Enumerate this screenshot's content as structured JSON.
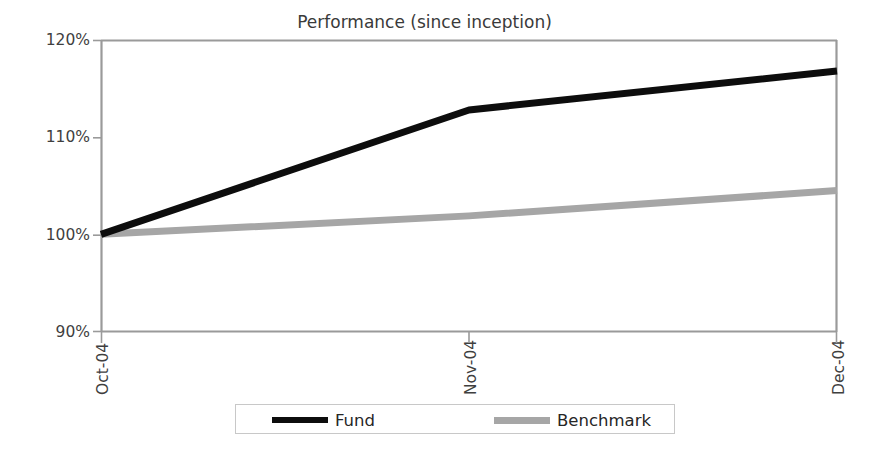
{
  "chart_data": {
    "type": "line",
    "title": "Performance (since inception)",
    "xlabel": "",
    "ylabel": "",
    "categories": [
      "Oct-04",
      "Nov-04",
      "Dec-04"
    ],
    "series": [
      {
        "name": "Fund",
        "values": [
          100.0,
          112.8,
          116.8
        ],
        "color": "#0d0d0d"
      },
      {
        "name": "Benchmark",
        "values": [
          100.0,
          101.9,
          104.5
        ],
        "color": "#a6a6a6"
      }
    ],
    "yticks": [
      "90%",
      "100%",
      "110%",
      "120%"
    ],
    "ytick_values": [
      90,
      100,
      110,
      120
    ],
    "ylim": [
      90,
      120
    ],
    "grid": false,
    "legend_position": "bottom",
    "axis_color": "#9a9a9a",
    "background": "#ffffff"
  },
  "chart": {
    "title": "Performance (since inception)",
    "ytick_labels": [
      "120%",
      "110%",
      "100%",
      "90%"
    ],
    "xtick_labels": [
      "Oct-04",
      "Nov-04",
      "Dec-04"
    ],
    "legend": {
      "fund_label": "Fund",
      "benchmark_label": "Benchmark"
    }
  }
}
